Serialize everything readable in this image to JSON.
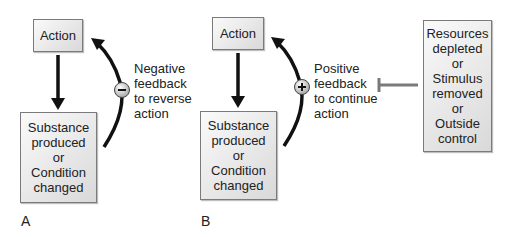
{
  "panels": [
    {
      "id": "A",
      "label": "A",
      "top_box": "Action",
      "bottom_box": "Substance\nproduced\nor\nCondition\nchanged",
      "feedback_sign": "−",
      "feedback_text": "Negative\nfeedback\nto reverse\naction"
    },
    {
      "id": "B",
      "label": "B",
      "top_box": "Action",
      "bottom_box": "Substance\nproduced\nor\nCondition\nchanged",
      "feedback_sign": "+",
      "feedback_text": "Positive\nfeedback\nto continue\naction",
      "inhibitor_box": "Resources\ndepleted\nor\nStimulus\nremoved\nor\nOutside\ncontrol"
    }
  ],
  "colors": {
    "arrow": "#111111",
    "inhibitor": "#7a7a7a",
    "box_border": "#7a7a7a"
  }
}
